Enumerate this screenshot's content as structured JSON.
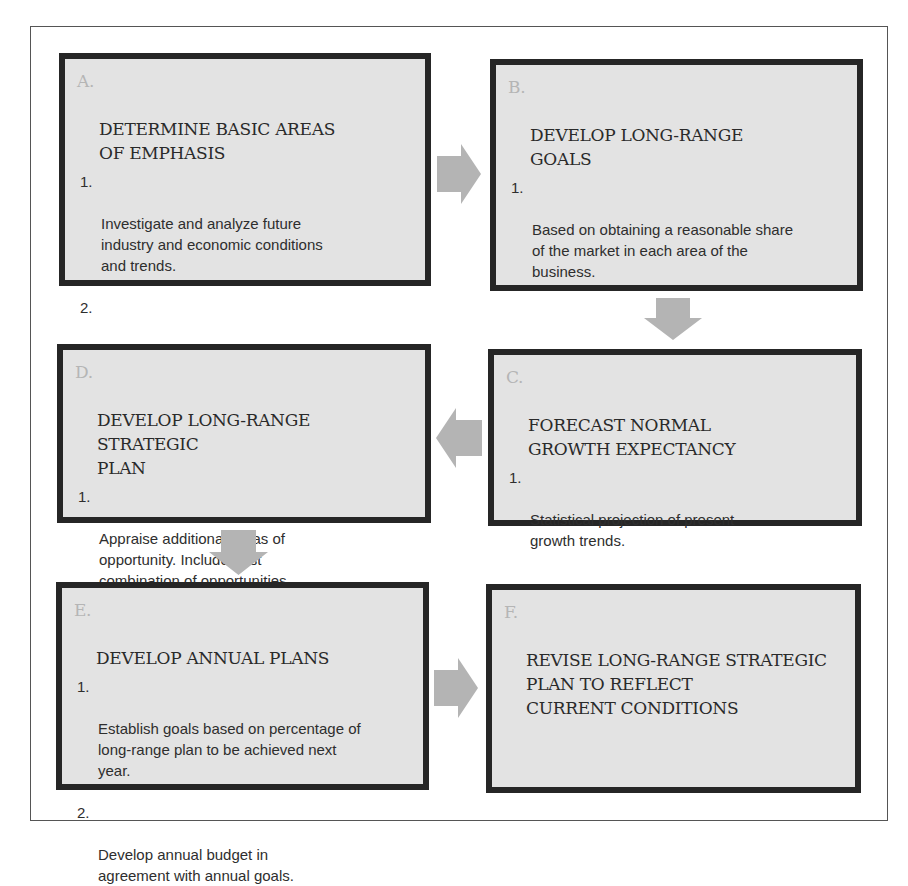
{
  "diagram": {
    "type": "flowchart",
    "colors": {
      "box_fill": "#e3e3e3",
      "box_border": "#262626",
      "arrow_fill": "#b4b4b4",
      "letter_color": "#b5b5b5",
      "frame_border": "#555555"
    },
    "boxes": [
      {
        "id": "A",
        "letter": "A.",
        "title": "DETERMINE BASIC AREAS\nOF EMPHASIS",
        "items": [
          {
            "num": "1.",
            "text": "Investigate and analyze future\nindustry and economic conditions\nand trends."
          },
          {
            "num": "2.",
            "text": "Develop future areas of business\nemphasis."
          }
        ]
      },
      {
        "id": "B",
        "letter": "B.",
        "title": "DEVELOP LONG-RANGE\nGOALS",
        "items": [
          {
            "num": "1.",
            "text": "Based on obtaining a reasonable share\nof the market in each area of the\nbusiness."
          }
        ]
      },
      {
        "id": "C",
        "letter": "C.",
        "title": "FORECAST NORMAL\nGROWTH EXPECTANCY",
        "items": [
          {
            "num": "1.",
            "text": "Statistical projection of present\ngrowth trends."
          }
        ]
      },
      {
        "id": "D",
        "letter": "D.",
        "title": "DEVELOP LONG-RANGE STRATEGIC\nPLAN",
        "items": [
          {
            "num": "1.",
            "text": "Appraise additional areas of\nopportunity. Include best\ncombination of opportunities\nwith normal growth expectancy."
          }
        ]
      },
      {
        "id": "E",
        "letter": "E.",
        "title": "DEVELOP ANNUAL PLANS",
        "items": [
          {
            "num": "1.",
            "text": "Establish goals based on percentage of\nlong-range plan to be achieved next\nyear."
          },
          {
            "num": "2.",
            "text": "Develop annual budget in\nagreement with annual goals."
          }
        ]
      },
      {
        "id": "F",
        "letter": "F.",
        "title": "REVISE LONG-RANGE STRATEGIC\nPLAN TO REFLECT\nCURRENT CONDITIONS",
        "items": []
      }
    ],
    "arrows": [
      {
        "from": "A",
        "to": "B",
        "direction": "right"
      },
      {
        "from": "B",
        "to": "C",
        "direction": "down"
      },
      {
        "from": "C",
        "to": "D",
        "direction": "left"
      },
      {
        "from": "D",
        "to": "E",
        "direction": "down"
      },
      {
        "from": "E",
        "to": "F",
        "direction": "right"
      }
    ]
  }
}
